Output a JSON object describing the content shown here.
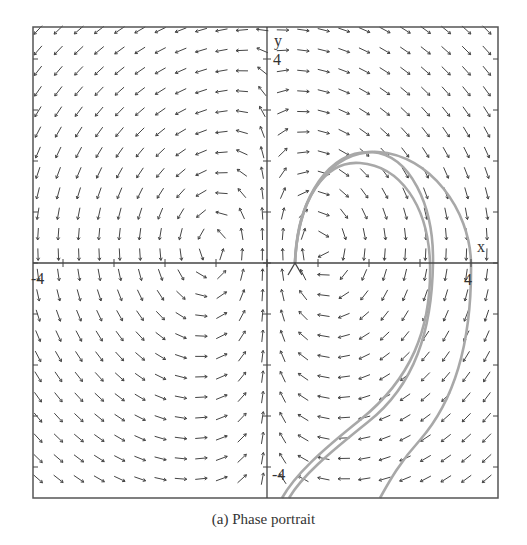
{
  "figure": {
    "caption": "(a) Phase portrait",
    "type": "phase portrait (direction field with trajectories)"
  },
  "axes": {
    "x_label": "x",
    "y_label": "y",
    "x_range": [
      -4.5,
      4.5
    ],
    "y_range": [
      -4.5,
      4.5
    ],
    "x_tick_labels": {
      "neg": "-4",
      "pos": "4"
    },
    "y_tick_labels": {
      "neg": "-4",
      "pos": "4"
    }
  },
  "colors": {
    "frame": "#555555",
    "arrow": "#444444",
    "trajectory": "#a8a8a8",
    "text": "#333333"
  },
  "direction_field": {
    "grid_cols": 23,
    "grid_rows": 23,
    "description": "Arrow field: clockwise circulation in upper-right, leftward/down-left flow in upper-left, down-right in lower-left, down-left in lower-right"
  },
  "trajectories": [
    {
      "name": "inner-loop-a",
      "start": [
        0.6,
        0.0
      ]
    },
    {
      "name": "inner-loop-b",
      "start": [
        0.6,
        0.0
      ]
    },
    {
      "name": "outer-loop",
      "start": [
        0.6,
        0.0
      ]
    }
  ]
}
